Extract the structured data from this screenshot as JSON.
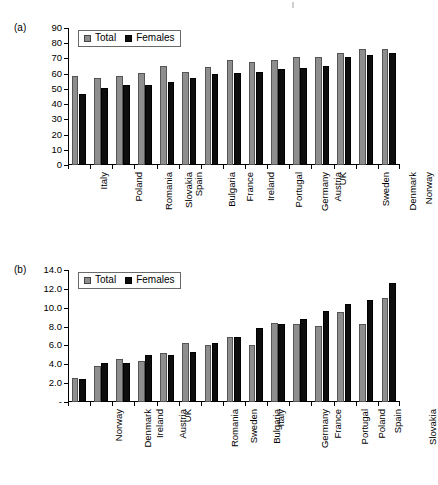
{
  "figure": {
    "background": "#ffffff",
    "total_color": "#8e8e8e",
    "females_color": "#0d0d0d"
  },
  "panels": [
    {
      "id": "a",
      "label": "(a)",
      "legend": {
        "total_label": "Total",
        "females_label": "Females"
      },
      "chart_data": {
        "type": "bar",
        "title": "",
        "xlabel": "",
        "ylabel": "",
        "ylim": [
          0,
          90
        ],
        "yticks": [
          "0",
          "10",
          "20",
          "30",
          "40",
          "50",
          "60",
          "70",
          "80",
          "90"
        ],
        "grid": false,
        "legend_position": "top-left",
        "categories": [
          "Italy",
          "Poland",
          "Romania",
          "Slovakia",
          "Spain",
          "Bulgaria",
          "France",
          "Ireland",
          "Portugal",
          "Germany",
          "Austria",
          "UK",
          "Sweden",
          "Denmark",
          "Norway"
        ],
        "series": [
          {
            "name": "Total",
            "values": [
              58.5,
              57.0,
              58.8,
              60.3,
              65.2,
              61.2,
              64.1,
              68.8,
              67.4,
              69.1,
              71.0,
              70.9,
              73.4,
              76.4,
              76.0
            ]
          },
          {
            "name": "Females",
            "values": [
              46.5,
              50.5,
              52.8,
              52.6,
              54.3,
              57.2,
              59.5,
              60.2,
              61.4,
              63.4,
              63.9,
              65.1,
              71.0,
              72.4,
              73.3
            ]
          }
        ]
      }
    },
    {
      "id": "b",
      "label": "(b)",
      "legend": {
        "total_label": "Total",
        "females_label": "Females"
      },
      "chart_data": {
        "type": "bar",
        "title": "",
        "xlabel": "",
        "ylabel": "",
        "ylim": [
          0,
          14
        ],
        "yticks": [
          "-",
          "2.0",
          "4.0",
          "6.0",
          "8.0",
          "10.0",
          "12.0",
          "14.0"
        ],
        "grid": false,
        "legend_position": "top-left",
        "categories": [
          "Norway",
          "Denmark",
          "Ireland",
          "Austria",
          "UK",
          "Romania",
          "Sweden",
          "Bulgaria",
          "Italy",
          "Germany",
          "France",
          "Portugal",
          "Poland",
          "Spain",
          "Slovakia"
        ],
        "series": [
          {
            "name": "Total",
            "values": [
              2.55,
              3.78,
              4.55,
              4.35,
              5.25,
              6.3,
              6.05,
              6.85,
              6.0,
              8.35,
              8.3,
              8.05,
              9.55,
              8.3,
              11.05
            ]
          },
          {
            "name": "Females",
            "values": [
              2.45,
              4.15,
              4.1,
              4.95,
              4.95,
              5.3,
              6.3,
              6.9,
              7.85,
              8.25,
              8.85,
              9.65,
              10.35,
              10.85,
              12.6
            ]
          }
        ]
      }
    }
  ]
}
